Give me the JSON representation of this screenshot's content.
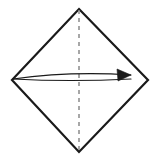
{
  "figure": {
    "background_color": "#ffffff",
    "canvas": {
      "width": 161,
      "height": 160
    }
  },
  "shape": {
    "name": "diamond-outline",
    "kind": "square-rotated-45",
    "stroke_color": "#1a1a1a",
    "stroke_width": 2.2,
    "fill": "none",
    "vertices": [
      {
        "name": "top",
        "x": 79,
        "y": 9
      },
      {
        "name": "right",
        "x": 148,
        "y": 80
      },
      {
        "name": "bottom",
        "x": 79,
        "y": 152
      },
      {
        "name": "left",
        "x": 12,
        "y": 80
      }
    ]
  },
  "fold_line": {
    "name": "vertical-dashed-fold-line",
    "kind": "dashed-crease",
    "stroke_color": "#8a8a8a",
    "stroke_width": 1.5,
    "dash_pattern": "4 4",
    "from": {
      "x": 79,
      "y": 10
    },
    "to": {
      "x": 79,
      "y": 151
    }
  },
  "arrow": {
    "name": "fold-direction-arrow",
    "kind": "curved-lens-arrow",
    "direction": "right",
    "stroke_color": "#1a1a1a",
    "fill_color": "#1a1a1a",
    "stroke_width": 1.1,
    "tail": {
      "x": 13,
      "y": 79
    },
    "tip": {
      "x": 131,
      "y": 75
    },
    "upper_curve_control": {
      "x": 70,
      "y": 71
    },
    "lower_curve_control": {
      "x": 70,
      "y": 82
    },
    "head": {
      "name": "arrowhead",
      "points": "131,75 117,69 118,81"
    }
  }
}
